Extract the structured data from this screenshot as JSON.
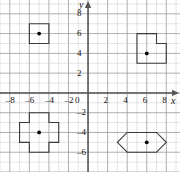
{
  "chart_data": {
    "type": "scatter",
    "title": "",
    "xlabel": "x",
    "ylabel": "y",
    "xlim": [
      -9,
      9.4
    ],
    "ylim": [
      -8,
      9.4
    ],
    "grid": true,
    "grid_step": 1,
    "tick_step": 2,
    "xticks": [
      -8,
      -6,
      -4,
      -2,
      0,
      2,
      4,
      6,
      8
    ],
    "xtick_labels": [
      "–8",
      "–6",
      "–4",
      "–2",
      "0",
      "2",
      "4",
      "6",
      "8"
    ],
    "yticks": [
      8,
      6,
      4,
      2,
      -2,
      -4,
      -6
    ],
    "ytick_labels": [
      "8",
      "6",
      "4",
      "2",
      "–2",
      "–4",
      "–6"
    ],
    "origin_label": "0",
    "legend": null,
    "annotations": [],
    "shapes": [
      {
        "name": "square",
        "center": [
          -5,
          6
        ],
        "marker": "filled-dot",
        "vertices": [
          [
            -6,
            5
          ],
          [
            -6,
            7
          ],
          [
            -4,
            7
          ],
          [
            -4,
            5
          ]
        ]
      },
      {
        "name": "notched-square",
        "center": [
          6,
          4
        ],
        "marker": "filled-dot",
        "vertices": [
          [
            5,
            3
          ],
          [
            5,
            6
          ],
          [
            7,
            6
          ],
          [
            7,
            5
          ],
          [
            8,
            5
          ],
          [
            8,
            3
          ]
        ]
      },
      {
        "name": "cross",
        "center": [
          -5,
          -4
        ],
        "marker": "filled-dot",
        "vertices": [
          [
            -6,
            -2
          ],
          [
            -4,
            -2
          ],
          [
            -4,
            -3
          ],
          [
            -3,
            -3
          ],
          [
            -3,
            -5
          ],
          [
            -4,
            -5
          ],
          [
            -4,
            -6
          ],
          [
            -6,
            -6
          ],
          [
            -6,
            -5
          ],
          [
            -7,
            -5
          ],
          [
            -7,
            -3
          ],
          [
            -6,
            -3
          ]
        ]
      },
      {
        "name": "hexagon",
        "center": [
          6,
          -5
        ],
        "marker": "filled-dot",
        "vertices": [
          [
            4,
            -4
          ],
          [
            7,
            -4
          ],
          [
            8,
            -5
          ],
          [
            7,
            -6
          ],
          [
            4,
            -6
          ],
          [
            3,
            -5
          ]
        ]
      }
    ],
    "colors": {
      "grid_minor": "#c9c9c9",
      "grid_major": "#9a9a9a",
      "axis": "#555555",
      "shape_stroke": "#3a3a3a",
      "marker": "#000000",
      "background": "#ffffff",
      "text": "#111111"
    }
  }
}
